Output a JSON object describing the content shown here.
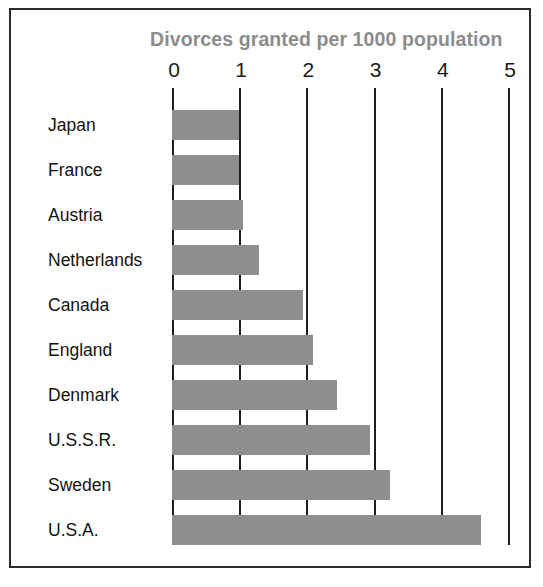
{
  "chart_data": {
    "type": "bar",
    "orientation": "horizontal",
    "title": "Divorces granted per 1000 population",
    "xlabel": "",
    "ylabel": "",
    "xlim": [
      0,
      5
    ],
    "xticks": [
      "0",
      "1",
      "2",
      "3",
      "4",
      "5"
    ],
    "grid": true,
    "legend": false,
    "bar_color": "#8e8e8e",
    "title_color": "#8c8c8c",
    "axis_color": "#1e1e1e",
    "categories": [
      "Japan",
      "France",
      "Austria",
      "Netherlands",
      "Canada",
      "England",
      "Denmark",
      "U.S.S.R.",
      "Sweden",
      "U.S.A."
    ],
    "values": [
      1.0,
      1.0,
      1.05,
      1.3,
      1.95,
      2.1,
      2.45,
      2.95,
      3.25,
      4.6
    ]
  }
}
